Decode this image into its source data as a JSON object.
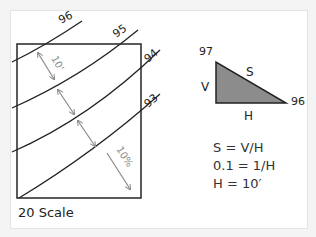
{
  "diagram": {
    "type": "contour-slope-illustration",
    "contours": [
      {
        "label": "96",
        "elevation": 96
      },
      {
        "label": "95",
        "elevation": 95
      },
      {
        "label": "94",
        "elevation": 94
      },
      {
        "label": "93",
        "elevation": 93
      }
    ],
    "spacing_label": "10'",
    "slope_label": "10%",
    "scale_label": "20 Scale",
    "triangle": {
      "top_label": "97",
      "right_label": "96",
      "vertical_label": "V",
      "horizontal_label": "H",
      "slope_label": "S",
      "fill_color": "#8c8c8c"
    },
    "equations": [
      "S = V/H",
      "0.1 = 1/H",
      "H = 10′"
    ]
  }
}
